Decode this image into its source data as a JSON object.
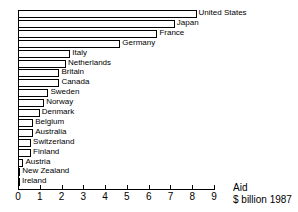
{
  "chart_data": {
    "type": "bar",
    "orientation": "horizontal",
    "title": "",
    "xlabel": "Aid $ billion 1987",
    "ylabel": "",
    "xlim": [
      0,
      9
    ],
    "xticks": [
      0,
      1,
      2,
      3,
      4,
      5,
      6,
      7,
      8,
      9
    ],
    "grid": false,
    "legend": false,
    "categories": [
      "United States",
      "Japan",
      "France",
      "Germany",
      "Italy",
      "Netherlands",
      "Britain",
      "Canada",
      "Sweden",
      "Norway",
      "Denmark",
      "Belgium",
      "Australia",
      "Switzerland",
      "Finland",
      "Austria",
      "New Zealand",
      "Ireland"
    ],
    "values": [
      8.2,
      7.2,
      6.4,
      4.7,
      2.4,
      2.2,
      1.9,
      1.9,
      1.4,
      1.2,
      1.0,
      0.7,
      0.7,
      0.6,
      0.6,
      0.25,
      0.1,
      0.05
    ]
  },
  "axis": {
    "tick_labels": [
      "0",
      "1",
      "2",
      "3",
      "4",
      "5",
      "6",
      "7",
      "8",
      "9"
    ],
    "title_line1": "Aid",
    "title_line2": "$ billion 1987"
  },
  "style": {
    "bar_fill": "#ffffff",
    "bar_stroke": "#000000",
    "axis_color": "#000000",
    "text_color": "#000000",
    "background": "#ffffff"
  }
}
